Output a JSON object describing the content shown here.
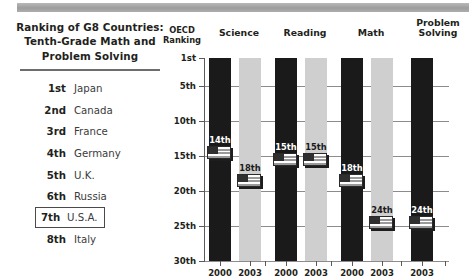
{
  "header_rule": {
    "name": "top-divider-bar"
  },
  "left_panel": {
    "title": "Ranking of G8 Countries: Tenth-Grade Math and Problem Solving",
    "title_line1": "Ranking of G8 Countries:",
    "title_line2": "Tenth-Grade Math and",
    "title_line3": "Problem Solving",
    "rows": [
      {
        "rank": "1st",
        "country": "Japan",
        "highlighted": false
      },
      {
        "rank": "2nd",
        "country": "Canada",
        "highlighted": false
      },
      {
        "rank": "3rd",
        "country": "France",
        "highlighted": false
      },
      {
        "rank": "4th",
        "country": "Germany",
        "highlighted": false
      },
      {
        "rank": "5th",
        "country": "U.K.",
        "highlighted": false
      },
      {
        "rank": "6th",
        "country": "Russia",
        "highlighted": false
      },
      {
        "rank": "7th",
        "country": "U.S.A.",
        "highlighted": true
      },
      {
        "rank": "8th",
        "country": "Italy",
        "highlighted": false
      }
    ]
  },
  "chart_axis_title_line1": "OECD",
  "chart_axis_title_line2": "Ranking",
  "chart_data": {
    "type": "bar",
    "title": "",
    "subtitle": "",
    "xlabel": "",
    "ylabel": "OECD Ranking",
    "ylim": [
      1,
      30
    ],
    "y_inverted": true,
    "grid": true,
    "legend": "none",
    "ytick_values": [
      1,
      5,
      10,
      15,
      20,
      25,
      30
    ],
    "ytick_labels": [
      "1st",
      "5th",
      "10th",
      "15th",
      "20th",
      "25th",
      "30th"
    ],
    "groups": [
      "Science",
      "Reading",
      "Math",
      "Problem Solving"
    ],
    "categories": [
      "2000",
      "2003"
    ],
    "series": [
      {
        "name": "Science",
        "bars": [
          {
            "year": "2000",
            "value": 14,
            "label": "14th",
            "style": "dark"
          },
          {
            "year": "2003",
            "value": 18,
            "label": "18th",
            "style": "light"
          }
        ]
      },
      {
        "name": "Reading",
        "bars": [
          {
            "year": "2000",
            "value": 15,
            "label": "15th",
            "style": "dark"
          },
          {
            "year": "2003",
            "value": 15,
            "label": "15th",
            "style": "light"
          }
        ]
      },
      {
        "name": "Math",
        "bars": [
          {
            "year": "2000",
            "value": 18,
            "label": "18th",
            "style": "dark"
          },
          {
            "year": "2003",
            "value": 24,
            "label": "24th",
            "style": "light"
          }
        ]
      },
      {
        "name": "Problem Solving",
        "bars": [
          {
            "year": "2003",
            "value": 24,
            "label": "24th",
            "style": "dark"
          }
        ]
      }
    ],
    "marker_icon": "us-flag-icon",
    "colors": {
      "dark_bar": "#1a1a1a",
      "light_bar": "#cfcfcf",
      "axis": "#5a5a5a",
      "grid": "#8c8c8c",
      "text": "#231f20"
    }
  }
}
